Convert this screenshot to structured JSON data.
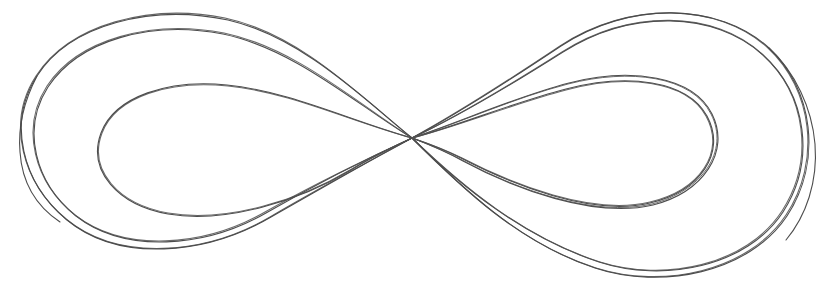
{
  "canvas": {
    "width": 834,
    "height": 292,
    "background_color": "#ffffff",
    "title": "hand-drawn-lemniscate"
  },
  "figure": {
    "name": "lemniscate-infinity-symbol",
    "crossing_point": {
      "x": 412,
      "y": 138
    },
    "bounding_box": {
      "left": 18,
      "top": 5,
      "right": 818,
      "bottom": 286
    },
    "stroke_color": "#4d4d4d",
    "stroke_width": 1.1,
    "fill": "none",
    "stroke_count": 5
  },
  "chart_data": {
    "type": "line",
    "title": "",
    "xlabel": "",
    "ylabel": "",
    "xlim": [
      0,
      834
    ],
    "ylim": [
      0,
      292
    ],
    "grid": false,
    "legend": "none",
    "series": [
      {
        "name": "trace-1-outer",
        "color": "#4a4a4a",
        "width": 1.1,
        "closed": true,
        "path": "M 412 138 C 360 96 300 34 225 18 C 150 3 70 24 36 76 C 6 122 22 182 66 219 C 118 262 205 255 270 217 C 330 182 372 160 412 138 C 452 116 500 86 560 46 C 628 1 718 2 768 48 C 812 89 822 161 786 215 C 748 272 662 289 596 268 C 520 244 462 188 412 138 Z"
      },
      {
        "name": "trace-2-outer-offset",
        "color": "#505050",
        "width": 1.1,
        "closed": true,
        "path": "M 412 138 C 358 104 296 48 224 33 C 152 19 78 39 47 86 C 20 128 34 182 75 215 C 124 253 204 247 265 212 C 326 177 370 158 412 138 C 454 118 502 90 562 52 C 630 9 714 10 762 54 C 806 94 815 160 782 211 C 746 266 664 282 600 262 C 524 238 462 186 412 138 Z"
      },
      {
        "name": "trace-3-inner-left",
        "color": "#4f4f4f",
        "width": 1.1,
        "closed": false,
        "path": "M 412 138 C 352 122 290 92 228 86 C 170 80 116 96 102 133 C 88 170 118 204 168 213 C 226 223 300 200 350 170 C 376 154 396 146 412 138"
      },
      {
        "name": "trace-4-inner-right",
        "color": "#4f4f4f",
        "width": 1.1,
        "closed": false,
        "path": "M 412 138 C 460 126 512 104 566 90 C 626 74 686 80 706 116 C 726 152 700 190 650 202 C 592 216 512 184 462 158 C 440 147 424 142 412 138"
      },
      {
        "name": "trace-5-inner-right-offset",
        "color": "#525252",
        "width": 1.0,
        "closed": false,
        "path": "M 412 138 C 462 122 514 98 568 84 C 630 68 692 76 711 114 C 730 151 702 191 652 204 C 594 218 514 188 464 161 C 441 149 425 143 412 138"
      }
    ]
  },
  "strokes": [
    {
      "id": "outer-loop-pass-a",
      "label": "outer-figure-eight-pass-a",
      "d": "M 412 138 C 364 99 302 37 228 20 C 152 4 70 24 37 76 C 7 122 22 183 67 220 C 119 263 206 255 271 217 C 331 183 372 159 412 138 C 452 117 501 86 561 46 C 629 1 719 2 769 48 C 813 89 823 161 787 216 C 749 273 661 290 595 268 C 519 243 461 187 412 138 Z"
    },
    {
      "id": "outer-loop-pass-b",
      "label": "outer-figure-eight-pass-b",
      "d": "M 412 138 C 357 105 295 49 223 34 C 151 20 79 40 48 87 C 21 129 35 183 76 216 C 125 254 205 248 266 213 C 327 178 370 157 412 138 C 455 118 503 90 563 52 C 631 9 715 11 763 55 C 807 95 816 161 783 212 C 747 267 663 283 599 262 C 523 237 461 186 412 138 Z"
    },
    {
      "id": "inner-left-loop",
      "label": "inner-left-loop",
      "d": "M 412 138 C 351 121 289 91 227 85 C 169 79 115 96 101 133 C 87 171 118 205 168 214 C 227 224 301 200 351 170 C 377 154 396 146 412 138"
    },
    {
      "id": "inner-right-loop-a",
      "label": "inner-right-loop-pass-a",
      "d": "M 412 138 C 460 125 512 103 566 89 C 627 73 687 80 707 116 C 727 153 700 191 650 203 C 591 217 511 184 461 158 C 439 147 424 142 412 138"
    },
    {
      "id": "inner-right-loop-b",
      "label": "inner-right-loop-pass-b",
      "d": "M 412 138 C 463 121 515 97 569 83 C 631 67 693 76 712 114 C 731 152 703 192 653 205 C 594 219 513 188 463 161 C 441 149 425 143 412 138"
    },
    {
      "id": "left-outer-tail",
      "label": "left-outer-converging-tail",
      "d": "M 37 76 C 24 101 18 128 20 152 C 22 182 36 206 60 222"
    },
    {
      "id": "right-outer-tail",
      "label": "right-outer-converging-tail",
      "d": "M 769 48 C 795 72 812 108 815 144 C 818 182 806 216 786 240"
    }
  ]
}
